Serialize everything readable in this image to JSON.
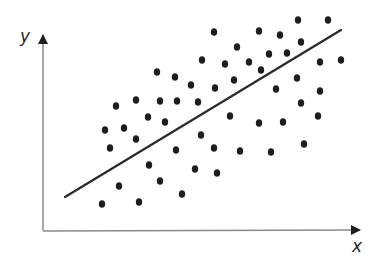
{
  "chart_data": {
    "type": "scatter",
    "title": "",
    "xlabel": "x",
    "ylabel": "y",
    "grid": false,
    "legend": null,
    "ticks": false,
    "colors": {
      "points": "#1e1e1e",
      "trend_line": "#2a2a2a",
      "axes": "#8a8a8a",
      "arrowheads": "#1e1e1e"
    },
    "axes_px": {
      "origin": [
        43,
        231
      ],
      "y_top": [
        43,
        33
      ],
      "x_right": [
        362,
        230
      ]
    },
    "trend_line_px": {
      "start": [
        65,
        197
      ],
      "end": [
        341,
        30
      ]
    },
    "points_px": [
      [
        157,
        72
      ],
      [
        175,
        77
      ],
      [
        191,
        85
      ],
      [
        116,
        106
      ],
      [
        136,
        100
      ],
      [
        160,
        101
      ],
      [
        177,
        101
      ],
      [
        148,
        117
      ],
      [
        165,
        122
      ],
      [
        105,
        130
      ],
      [
        124,
        128
      ],
      [
        136,
        139
      ],
      [
        110,
        148
      ],
      [
        176,
        150
      ],
      [
        149,
        165
      ],
      [
        160,
        181
      ],
      [
        119,
        186
      ],
      [
        182,
        194
      ],
      [
        102,
        204
      ],
      [
        139,
        202
      ],
      [
        214,
        32
      ],
      [
        259,
        31
      ],
      [
        280,
        35
      ],
      [
        298,
        20
      ],
      [
        328,
        20
      ],
      [
        301,
        42
      ],
      [
        287,
        53
      ],
      [
        237,
        47
      ],
      [
        202,
        60
      ],
      [
        225,
        64
      ],
      [
        249,
        62
      ],
      [
        269,
        54
      ],
      [
        261,
        70
      ],
      [
        320,
        62
      ],
      [
        341,
        60
      ],
      [
        297,
        78
      ],
      [
        320,
        91
      ],
      [
        191,
        85
      ],
      [
        215,
        88
      ],
      [
        234,
        80
      ],
      [
        276,
        89
      ],
      [
        198,
        102
      ],
      [
        230,
        116
      ],
      [
        259,
        123
      ],
      [
        283,
        122
      ],
      [
        201,
        135
      ],
      [
        214,
        148
      ],
      [
        240,
        151
      ],
      [
        271,
        152
      ],
      [
        195,
        169
      ],
      [
        217,
        173
      ],
      [
        301,
        103
      ],
      [
        318,
        116
      ],
      [
        304,
        144
      ]
    ]
  }
}
